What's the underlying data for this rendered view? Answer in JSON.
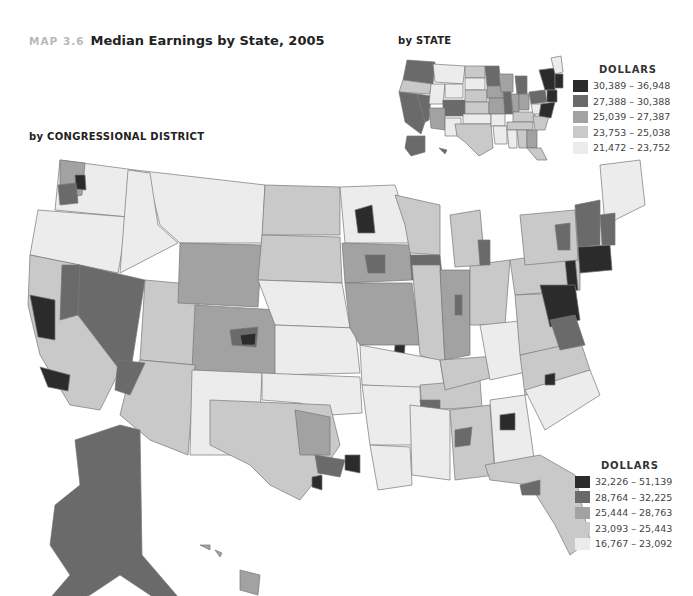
{
  "header": {
    "map_number": "MAP 3.6",
    "title": "Median Earnings by State, 2005"
  },
  "inset": {
    "subtitle": "by STATE",
    "legend": {
      "title": "DOLLARS",
      "items": [
        {
          "range": "30,389 – 36,948",
          "color": "#2b2b2b"
        },
        {
          "range": "27,388 – 30,388",
          "color": "#6a6a6a"
        },
        {
          "range": "25,039 – 27,387",
          "color": "#a2a2a2"
        },
        {
          "range": "23,753 – 25,038",
          "color": "#c9c9c9"
        },
        {
          "range": "21,472 – 23,752",
          "color": "#ececec"
        }
      ]
    }
  },
  "main_map": {
    "subtitle": "by CONGRESSIONAL DISTRICT",
    "legend": {
      "title": "DOLLARS",
      "items": [
        {
          "range": "32,226 – 51,139",
          "color": "#2b2b2b"
        },
        {
          "range": "28,764 – 32,225",
          "color": "#6a6a6a"
        },
        {
          "range": "25,444 – 28,763",
          "color": "#a2a2a2"
        },
        {
          "range": "23,093 – 25,443",
          "color": "#c9c9c9"
        },
        {
          "range": "16,767 – 23,092",
          "color": "#ececec"
        }
      ]
    }
  }
}
